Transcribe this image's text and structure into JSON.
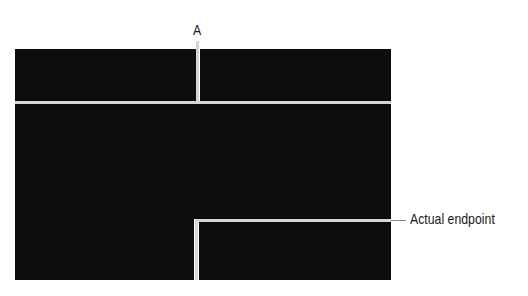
{
  "diagram": {
    "labels": {
      "a": "A",
      "endpoint": "Actual endpoint"
    },
    "colors": {
      "background": "#ffffff",
      "block": "#0d0d0d",
      "line": "#d6d6d6",
      "text": "#1a1a1a"
    }
  }
}
